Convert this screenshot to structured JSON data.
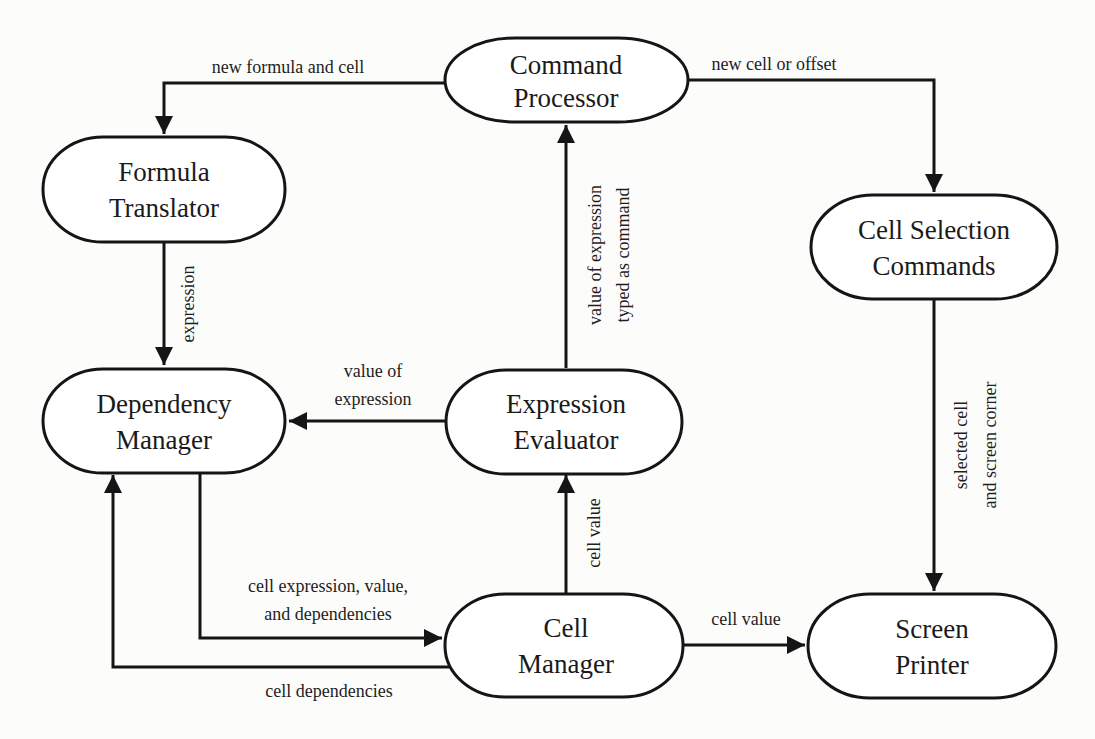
{
  "diagram": {
    "colors": {
      "stroke": "#151515",
      "text": "#1a1a1a",
      "background": "#fcfcfb"
    },
    "nodes": [
      {
        "id": "command-processor",
        "lines": [
          "Command",
          "Processor"
        ]
      },
      {
        "id": "formula-translator",
        "lines": [
          "Formula",
          "Translator"
        ]
      },
      {
        "id": "cell-selection-commands",
        "lines": [
          "Cell Selection",
          "Commands"
        ]
      },
      {
        "id": "dependency-manager",
        "lines": [
          "Dependency",
          "Manager"
        ]
      },
      {
        "id": "expression-evaluator",
        "lines": [
          "Expression",
          "Evaluator"
        ]
      },
      {
        "id": "cell-manager",
        "lines": [
          "Cell",
          "Manager"
        ]
      },
      {
        "id": "screen-printer",
        "lines": [
          "Screen",
          "Printer"
        ]
      }
    ],
    "edges": [
      {
        "from": "command-processor",
        "to": "formula-translator",
        "label": [
          "new formula and cell"
        ]
      },
      {
        "from": "command-processor",
        "to": "cell-selection-commands",
        "label": [
          "new cell or offset"
        ]
      },
      {
        "from": "formula-translator",
        "to": "dependency-manager",
        "label": [
          "expression"
        ]
      },
      {
        "from": "expression-evaluator",
        "to": "command-processor",
        "label": [
          "value of expression",
          "typed as command"
        ]
      },
      {
        "from": "expression-evaluator",
        "to": "dependency-manager",
        "label": [
          "value of",
          "expression"
        ]
      },
      {
        "from": "cell-selection-commands",
        "to": "screen-printer",
        "label": [
          "selected cell",
          "and screen corner"
        ]
      },
      {
        "from": "cell-manager",
        "to": "expression-evaluator",
        "label": [
          "cell value"
        ]
      },
      {
        "from": "dependency-manager",
        "to": "cell-manager",
        "label": [
          "cell expression, value,",
          "and dependencies"
        ]
      },
      {
        "from": "cell-manager",
        "to": "dependency-manager",
        "label": [
          "cell dependencies"
        ]
      },
      {
        "from": "cell-manager",
        "to": "screen-printer",
        "label": [
          "cell value"
        ]
      }
    ]
  }
}
